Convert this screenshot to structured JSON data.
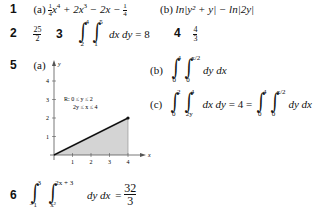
{
  "answers": [
    {
      "number": "1",
      "parts": [
        {
          "label": "(a)",
          "expr_pre": "",
          "coef1_num": "1",
          "coef1_den": "4",
          "term1": "x",
          "exp1": "4",
          "mid": " + 2x",
          "exp2": "3",
          "tail": " − 2x − ",
          "coef2_num": "1",
          "coef2_den": "4"
        },
        {
          "label": "(b)",
          "expr": "ln|y² + y| − ln|2y|"
        }
      ]
    },
    {
      "number": "2",
      "frac_num": "25",
      "frac_den": "2"
    },
    {
      "number": "3",
      "outer_lower": "2",
      "outer_upper": "4",
      "inner_lower": "1",
      "inner_upper": "5",
      "differentials": "dx dy",
      "result": "= 8"
    },
    {
      "number": "4",
      "frac_num": "4",
      "frac_den": "3"
    },
    {
      "number": "5",
      "parts": [
        {
          "label": "(a)"
        },
        {
          "label": "(b)",
          "outer_lower": "0",
          "outer_upper": "4",
          "inner_lower": "0",
          "inner_upper": "x/2",
          "differentials": "dy dx"
        },
        {
          "label": "(c)",
          "outer_lower": "0",
          "outer_upper": "2",
          "inner_lower": "2y",
          "inner_upper": "4",
          "differentials": "dx dy",
          "middle": "= 4 =",
          "outer2_lower": "0",
          "outer2_upper": "4",
          "inner2_lower": "0",
          "inner2_upper": "x/2",
          "differentials2": "dy dx"
        }
      ],
      "graph": {
        "y_axis_label": "y",
        "x_axis_label": "x",
        "y_ticks": [
          "1",
          "2",
          "3",
          "4"
        ],
        "x_ticks": [
          "1",
          "2",
          "3",
          "4"
        ],
        "region_label_line1": "R: 0 ≤ y ≤ 2",
        "region_label_line2": "2y ≤ x ≤ 4",
        "fill_color": "#d4d4d4",
        "line_color": "#111111"
      }
    },
    {
      "number": "6",
      "outer_lower": "−1",
      "outer_upper": "3",
      "inner_lower": "x²",
      "inner_upper": "2x + 3",
      "differentials": "dy dx",
      "result_eq": "=",
      "result_num": "32",
      "result_den": "3"
    }
  ]
}
